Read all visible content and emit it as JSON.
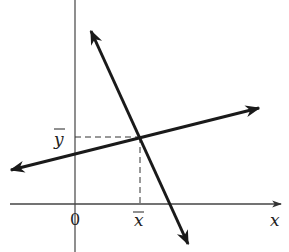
{
  "diagram": {
    "labels": {
      "x_axis": "x",
      "origin": "0",
      "x_mean": "x",
      "y_mean": "y"
    },
    "colors": {
      "line": "#1a1a1a",
      "axis": "#444444",
      "dash": "#333333",
      "background": "#ffffff"
    },
    "geometry": {
      "x_axis": {
        "x1": 10,
        "y1": 204,
        "x2": 281,
        "y2": 204
      },
      "y_axis": {
        "x1": 75,
        "y1": 0,
        "x2": 75,
        "y2": 252
      },
      "steep_line": {
        "x1": 91,
        "y1": 31,
        "x2": 188,
        "y2": 244
      },
      "shallow_line": {
        "x1": 11,
        "y1": 170,
        "x2": 259,
        "y2": 108
      },
      "intersection": {
        "x": 140,
        "y": 137
      }
    }
  }
}
